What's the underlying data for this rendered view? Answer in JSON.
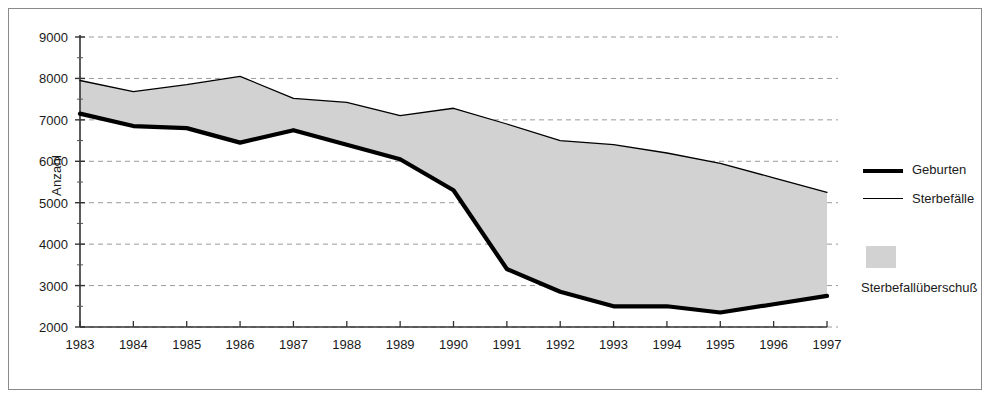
{
  "chart_data": {
    "type": "area",
    "title": "",
    "subtitle": "",
    "xlabel": "",
    "ylabel": "Anzahl",
    "categories": [
      "1983",
      "1984",
      "1985",
      "1986",
      "1987",
      "1988",
      "1989",
      "1990",
      "1991",
      "1992",
      "1993",
      "1994",
      "1995",
      "1996",
      "1997"
    ],
    "series": [
      {
        "name": "Geburten",
        "style": "thick-line",
        "color": "#000000",
        "values": [
          7150,
          6850,
          6800,
          6450,
          6750,
          6400,
          6050,
          5300,
          3400,
          2850,
          2500,
          2500,
          2350,
          2550,
          2750
        ]
      },
      {
        "name": "Sterbefälle",
        "style": "thin-line",
        "color": "#000000",
        "values": [
          7950,
          7680,
          7850,
          8050,
          7520,
          7420,
          7100,
          7280,
          6900,
          6500,
          6400,
          6200,
          5950,
          5600,
          5250
        ]
      }
    ],
    "fill_between": {
      "name": "Sterbefallüberschuß",
      "color": "#d2d2d2",
      "upper_series": "Sterbefälle",
      "lower_series": "Geburten"
    },
    "ylim": [
      2000,
      9000
    ],
    "ytick_step": 1000,
    "yticks": [
      "9000",
      "8000",
      "7000",
      "6000",
      "5000",
      "4000",
      "3000",
      "2000"
    ],
    "xticks": [
      "1983",
      "1984",
      "1985",
      "1986",
      "1987",
      "1988",
      "1989",
      "1990",
      "1991",
      "1992",
      "1993",
      "1994",
      "1995",
      "1996",
      "1997"
    ],
    "grid": "horizontal-dashed",
    "grid_color": "#9a9a9a",
    "legend_position": "right"
  },
  "axes": {
    "y_title": "Anzahl",
    "y_ticks": [
      "9000",
      "8000",
      "7000",
      "6000",
      "5000",
      "4000",
      "3000",
      "2000"
    ],
    "x_ticks": [
      "1983",
      "1984",
      "1985",
      "1986",
      "1987",
      "1988",
      "1989",
      "1990",
      "1991",
      "1992",
      "1993",
      "1994",
      "1995",
      "1996",
      "1997"
    ]
  },
  "legend": {
    "entries": [
      {
        "label": "Geburten",
        "marker": "thick-line"
      },
      {
        "label": "Sterbefälle",
        "marker": "thin-line"
      },
      {
        "label": "Sterbefallüberschuß",
        "marker": "area-swatch"
      }
    ]
  },
  "caption": {
    "text": ""
  },
  "colors": {
    "area_fill": "#d2d2d2",
    "line": "#000000",
    "grid": "#9a9a9a",
    "frame": "#8a8a8a",
    "text": "#1a1a1a"
  }
}
